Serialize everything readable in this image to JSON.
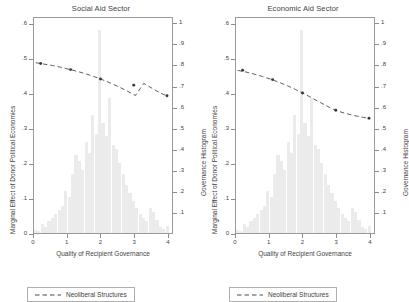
{
  "figure": {
    "panels": [
      {
        "title": "Social Aid Sector",
        "ylabel_left": "Marginal Effect of Donor Political Economies",
        "ylabel_right": "Governance Histogram",
        "xlabel": "Quality of Recipient Governance",
        "legend_label": "Neoliberal Structures"
      },
      {
        "title": "Economic Aid Sector",
        "ylabel_left": "Marginal Effect of Donor Political Economies",
        "ylabel_right": "Governance Histogram",
        "xlabel": "Quality of Recipient Governance",
        "legend_label": "Neoliberal Structures"
      }
    ]
  },
  "chart_data": [
    {
      "type": "line",
      "title": "Social Aid Sector",
      "xlabel": "Quality of Recipient Governance",
      "ylabel": "Marginal Effect of Donor Political Economies",
      "ylabel_secondary": "Governance Histogram",
      "xlim": [
        0,
        4.15
      ],
      "ylim": [
        0,
        0.62
      ],
      "ylim_secondary": [
        0,
        1.03
      ],
      "grid": false,
      "legend_position": "below-axes",
      "xticks": [
        "0",
        "1",
        "2",
        "3",
        "4"
      ],
      "xtick_values": [
        0,
        1,
        2,
        3,
        4
      ],
      "yticks_left": [
        ".6",
        ".5",
        ".4",
        ".3",
        ".2",
        ".1",
        "0"
      ],
      "ytick_left_values": [
        0.6,
        0.5,
        0.4,
        0.3,
        0.2,
        0.1,
        0.0
      ],
      "yticks_right": [
        "1",
        ".9",
        ".8",
        ".7",
        ".6",
        ".5",
        ".4",
        ".3",
        ".2",
        ".1"
      ],
      "ytick_right_values": [
        1.0,
        0.9,
        0.8,
        0.7,
        0.6,
        0.5,
        0.4,
        0.3,
        0.2,
        0.1
      ],
      "series": [
        {
          "name": "Neoliberal Structures",
          "style": "dashed",
          "color": "#4a4a4a",
          "x": [
            0.05,
            0.3,
            0.55,
            0.8,
            1.05,
            1.3,
            1.55,
            1.8,
            2.05,
            2.3,
            2.55,
            2.8,
            3.05,
            3.3,
            3.55,
            3.8,
            4.0
          ],
          "y": [
            0.492,
            0.488,
            0.484,
            0.479,
            0.473,
            0.467,
            0.46,
            0.452,
            0.443,
            0.433,
            0.422,
            0.41,
            0.397,
            0.432,
            0.418,
            0.404,
            0.396
          ]
        }
      ],
      "markers": {
        "name": "Neoliberal Structures point estimates",
        "x": [
          0.2,
          1.1,
          2.0,
          3.0,
          4.0
        ],
        "y": [
          0.49,
          0.472,
          0.445,
          0.427,
          0.396
        ]
      },
      "histogram": {
        "name": "Governance Histogram",
        "color": "#ebebeb",
        "bin_centers": [
          0.05,
          0.15,
          0.25,
          0.35,
          0.45,
          0.55,
          0.65,
          0.75,
          0.85,
          0.95,
          1.05,
          1.15,
          1.25,
          1.35,
          1.45,
          1.55,
          1.65,
          1.75,
          1.85,
          1.95,
          2.05,
          2.15,
          2.25,
          2.35,
          2.45,
          2.55,
          2.65,
          2.75,
          2.85,
          2.95,
          3.05,
          3.15,
          3.25,
          3.35,
          3.45,
          3.55,
          3.65,
          3.75,
          3.85,
          3.95
        ],
        "bin_width": 0.1,
        "values": [
          0.015,
          0.01,
          0.045,
          0.03,
          0.055,
          0.07,
          0.09,
          0.11,
          0.13,
          0.2,
          0.17,
          0.28,
          0.37,
          0.34,
          0.3,
          0.43,
          0.38,
          0.56,
          0.47,
          0.965,
          0.52,
          0.46,
          0.64,
          0.42,
          0.4,
          0.33,
          0.28,
          0.23,
          0.19,
          0.15,
          0.12,
          0.09,
          0.07,
          0.055,
          0.12,
          0.1,
          0.06,
          0.03,
          0.02,
          0.035
        ]
      }
    },
    {
      "type": "line",
      "title": "Economic Aid Sector",
      "xlabel": "Quality of Recipient Governance",
      "ylabel": "Marginal Effect of Donor Political Economies",
      "ylabel_secondary": "Governance Histogram",
      "xlim": [
        0,
        4.15
      ],
      "ylim": [
        0,
        0.62
      ],
      "ylim_secondary": [
        0,
        1.03
      ],
      "grid": false,
      "legend_position": "below-axes",
      "xticks": [
        "0",
        "1",
        "2",
        "3",
        "4"
      ],
      "xtick_values": [
        0,
        1,
        2,
        3,
        4
      ],
      "yticks_left": [
        ".6",
        ".5",
        ".4",
        ".3",
        ".2",
        ".1",
        "0"
      ],
      "ytick_left_values": [
        0.6,
        0.5,
        0.4,
        0.3,
        0.2,
        0.1,
        0.0
      ],
      "yticks_right": [
        "1",
        ".9",
        ".8",
        ".7",
        ".6",
        ".5",
        ".4",
        ".3",
        ".2",
        ".1"
      ],
      "ytick_right_values": [
        1.0,
        0.9,
        0.8,
        0.7,
        0.6,
        0.5,
        0.4,
        0.3,
        0.2,
        0.1
      ],
      "series": [
        {
          "name": "Neoliberal Structures",
          "style": "dashed",
          "color": "#4a4a4a",
          "x": [
            0.05,
            0.3,
            0.55,
            0.8,
            1.05,
            1.3,
            1.55,
            1.8,
            2.05,
            2.3,
            2.55,
            2.8,
            3.05,
            3.3,
            3.55,
            3.8,
            4.0
          ],
          "y": [
            0.47,
            0.465,
            0.459,
            0.452,
            0.444,
            0.435,
            0.425,
            0.414,
            0.402,
            0.389,
            0.376,
            0.363,
            0.352,
            0.345,
            0.339,
            0.334,
            0.331
          ]
        }
      ],
      "markers": {
        "name": "Neoliberal Structures point estimates",
        "x": [
          0.2,
          1.1,
          2.0,
          3.0,
          4.0
        ],
        "y": [
          0.47,
          0.443,
          0.404,
          0.354,
          0.331
        ]
      },
      "histogram": {
        "name": "Governance Histogram",
        "color": "#ebebeb",
        "bin_centers": [
          0.05,
          0.15,
          0.25,
          0.35,
          0.45,
          0.55,
          0.65,
          0.75,
          0.85,
          0.95,
          1.05,
          1.15,
          1.25,
          1.35,
          1.45,
          1.55,
          1.65,
          1.75,
          1.85,
          1.95,
          2.05,
          2.15,
          2.25,
          2.35,
          2.45,
          2.55,
          2.65,
          2.75,
          2.85,
          2.95,
          3.05,
          3.15,
          3.25,
          3.35,
          3.45,
          3.55,
          3.65,
          3.75,
          3.85,
          3.95
        ],
        "bin_width": 0.1,
        "values": [
          0.015,
          0.01,
          0.045,
          0.03,
          0.055,
          0.07,
          0.09,
          0.11,
          0.13,
          0.2,
          0.17,
          0.28,
          0.37,
          0.34,
          0.3,
          0.43,
          0.38,
          0.56,
          0.47,
          0.965,
          0.52,
          0.46,
          0.64,
          0.42,
          0.4,
          0.33,
          0.28,
          0.23,
          0.19,
          0.15,
          0.12,
          0.09,
          0.07,
          0.055,
          0.12,
          0.1,
          0.06,
          0.03,
          0.02,
          0.035
        ]
      }
    }
  ]
}
